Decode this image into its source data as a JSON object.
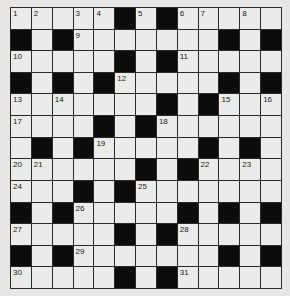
{
  "puzzle": {
    "type": "crossword",
    "rows": 13,
    "cols": 13,
    "colors": {
      "background": "#e6e6e4",
      "cell": "#ebebe9",
      "block": "#0c0c0c",
      "gridline": "#2a2a2a"
    },
    "grid": [
      [
        "1",
        "2",
        ".",
        "3",
        "4",
        "#",
        "5",
        "#",
        "6",
        "7",
        ".",
        "8",
        "."
      ],
      [
        "#",
        ".",
        "#",
        "9",
        ".",
        ".",
        ".",
        ".",
        ".",
        ".",
        "#",
        ".",
        "#"
      ],
      [
        "10",
        ".",
        ".",
        ".",
        ".",
        "#",
        ".",
        "#",
        "11",
        ".",
        ".",
        ".",
        "."
      ],
      [
        "#",
        ".",
        "#",
        ".",
        "#",
        "12",
        ".",
        ".",
        ".",
        ".",
        "#",
        ".",
        "#"
      ],
      [
        "13",
        ".",
        "14",
        ".",
        ".",
        ".",
        ".",
        "#",
        ".",
        "#",
        "15",
        ".",
        "16"
      ],
      [
        "17",
        ".",
        ".",
        ".",
        "#",
        ".",
        "#",
        "18",
        ".",
        ".",
        ".",
        ".",
        "."
      ],
      [
        ".",
        "#",
        ".",
        "#",
        "19",
        ".",
        ".",
        ".",
        ".",
        "#",
        ".",
        "#",
        "."
      ],
      [
        "20",
        "21",
        ".",
        ".",
        ".",
        ".",
        "#",
        ".",
        "#",
        "22",
        ".",
        "23",
        "."
      ],
      [
        "24",
        ".",
        ".",
        "#",
        ".",
        "#",
        "25",
        ".",
        ".",
        ".",
        ".",
        ".",
        "."
      ],
      [
        "#",
        ".",
        "#",
        "26",
        ".",
        ".",
        ".",
        ".",
        "#",
        ".",
        "#",
        ".",
        "#"
      ],
      [
        "27",
        ".",
        ".",
        ".",
        ".",
        "#",
        ".",
        "#",
        "28",
        ".",
        ".",
        ".",
        "."
      ],
      [
        "#",
        ".",
        "#",
        "29",
        ".",
        ".",
        ".",
        ".",
        ".",
        ".",
        "#",
        ".",
        "#"
      ],
      [
        "30",
        ".",
        ".",
        ".",
        ".",
        "#",
        ".",
        "#",
        "31",
        ".",
        ".",
        ".",
        "."
      ]
    ],
    "legend": {
      "#": "black square",
      ".": "empty white square",
      "number": "white square with clue number"
    }
  }
}
